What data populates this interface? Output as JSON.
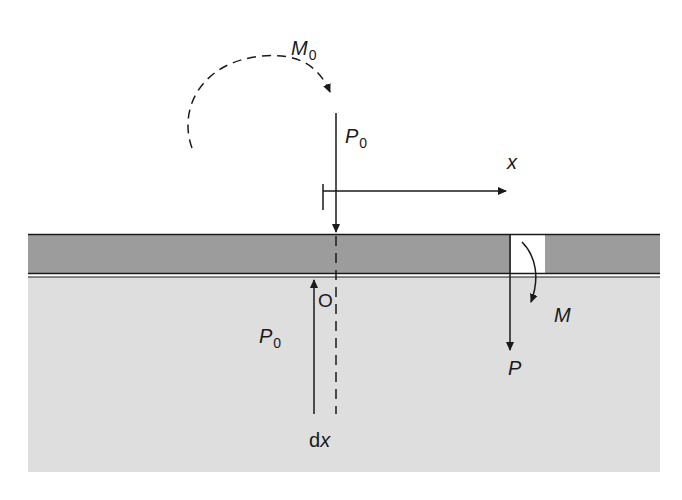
{
  "diagram": {
    "type": "beam-on-foundation-free-body",
    "colors": {
      "beam_fill": "#9c9c9c",
      "ground_fill": "#dedede",
      "line": "#1a1a1a",
      "gap_fill": "#ffffff"
    },
    "labels": {
      "applied_moment": {
        "main": "M",
        "sub": "0"
      },
      "applied_load": {
        "main": "P",
        "sub": "0"
      },
      "axis_x": "x",
      "origin": "O",
      "reaction_load": {
        "main": "P",
        "sub": "0"
      },
      "element_width": {
        "prefix": "d",
        "var": "x"
      },
      "section_moment": "M",
      "section_shear": "P"
    }
  }
}
